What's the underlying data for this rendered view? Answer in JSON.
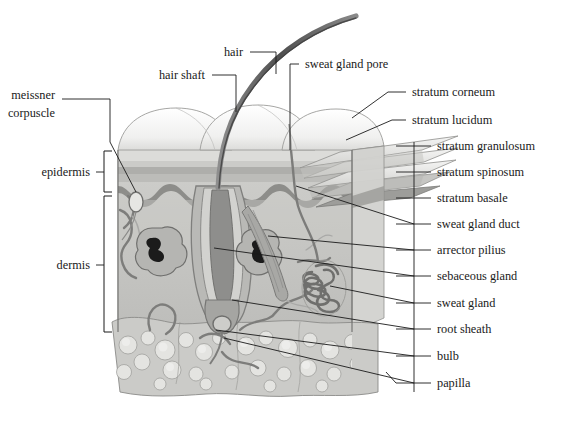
{
  "figure": {
    "background_color": "#ffffff",
    "label_color": "#1a1a1a",
    "leader_color": "#1a1a1a"
  },
  "labels_left": [
    {
      "id": "meissner-corpuscle",
      "line1": "meissner",
      "line2": "corpuscle",
      "x": 55,
      "y": 99,
      "anchor": "end"
    },
    {
      "id": "hair-shaft",
      "text": "hair shaft",
      "x": 205,
      "y": 79,
      "anchor": "end"
    },
    {
      "id": "hair",
      "text": "hair",
      "x": 243,
      "y": 56,
      "anchor": "end"
    },
    {
      "id": "sweat-gland-pore",
      "text": "sweat gland pore",
      "x": 305,
      "y": 68,
      "anchor": "start"
    }
  ],
  "brackets": [
    {
      "id": "epidermis",
      "text": "epidermis",
      "x": 90,
      "y": 172,
      "top": 151,
      "bottom": 192
    },
    {
      "id": "dermis",
      "text": "dermis",
      "x": 90,
      "y": 265,
      "top": 196,
      "bottom": 332
    }
  ],
  "labels_right": [
    {
      "id": "stratum-corneum",
      "text": "stratum corneum",
      "x": 412,
      "y": 96,
      "lead_x": 400,
      "lead_to_x": 352,
      "lead_to_y": 118
    },
    {
      "id": "stratum-lucidum",
      "text": "stratum lucidum",
      "x": 412,
      "y": 124,
      "lead_x": 400,
      "lead_to_x": 343,
      "lead_to_y": 140
    },
    {
      "id": "stratum-granulosum",
      "text": "stratum granulosum",
      "x": 437,
      "y": 150,
      "lead_x": 425,
      "lead_to_x": 372,
      "lead_to_y": 152
    },
    {
      "id": "stratum-spinosum",
      "text": "stratum spinosum",
      "x": 437,
      "y": 176,
      "lead_x": 425,
      "lead_to_x": 358,
      "lead_to_y": 178
    },
    {
      "id": "stratum-basale",
      "text": "stratum basale",
      "x": 437,
      "y": 202,
      "lead_x": 425,
      "lead_to_x": 340,
      "lead_to_y": 196
    },
    {
      "id": "sweat-gland-duct",
      "text": "sweat gland duct",
      "x": 437,
      "y": 228,
      "lead_x": 425,
      "lead_to_x": 296,
      "lead_to_y": 186
    },
    {
      "id": "arrector-pilius",
      "text": "arrector pilius",
      "x": 437,
      "y": 254,
      "lead_x": 425,
      "lead_to_x": 268,
      "lead_to_y": 236
    },
    {
      "id": "sebaceous-gland",
      "text": "sebaceous gland",
      "x": 437,
      "y": 280,
      "lead_x": 425,
      "lead_to_x": 214,
      "lead_to_y": 248
    },
    {
      "id": "sweat-gland",
      "text": "sweat gland",
      "x": 437,
      "y": 307,
      "lead_x": 425,
      "lead_to_x": 330,
      "lead_to_y": 286
    },
    {
      "id": "root-sheath",
      "text": "root sheath",
      "x": 437,
      "y": 333,
      "lead_x": 425,
      "lead_to_x": 232,
      "lead_to_y": 300
    },
    {
      "id": "bulb",
      "text": "bulb",
      "x": 437,
      "y": 360,
      "lead_x": 425,
      "lead_to_x": 216,
      "lead_to_y": 328
    },
    {
      "id": "papilla",
      "text": "papilla",
      "x": 437,
      "y": 387,
      "lead_x": 425,
      "lead_to_x": 222,
      "lead_to_y": 336
    }
  ],
  "palette": {
    "surface_dome": "#f2f2f2",
    "dome_edge": "#9a9a9a",
    "stratum_corneum": "#d8d8d6",
    "stratum_lucidum": "#c9c9c6",
    "stratum_granulosum": "#b4b4b1",
    "stratum_spinosum": "#a3a3a0",
    "stratum_basale": "#8a8a88",
    "dermis_fill": "#c6c6c3",
    "dermis_light": "#d6d6d3",
    "hypodermis": "#cfcfcc",
    "fat_cell": "#e0e0dd",
    "hair_dark": "#6e6e6e",
    "hair_core": "#4a4a4a",
    "vessel": "#7a7a78",
    "gland_outline": "#6f6f6d",
    "follicle_sheath": "#9e9e9b",
    "outline": "#5f5f5d"
  }
}
